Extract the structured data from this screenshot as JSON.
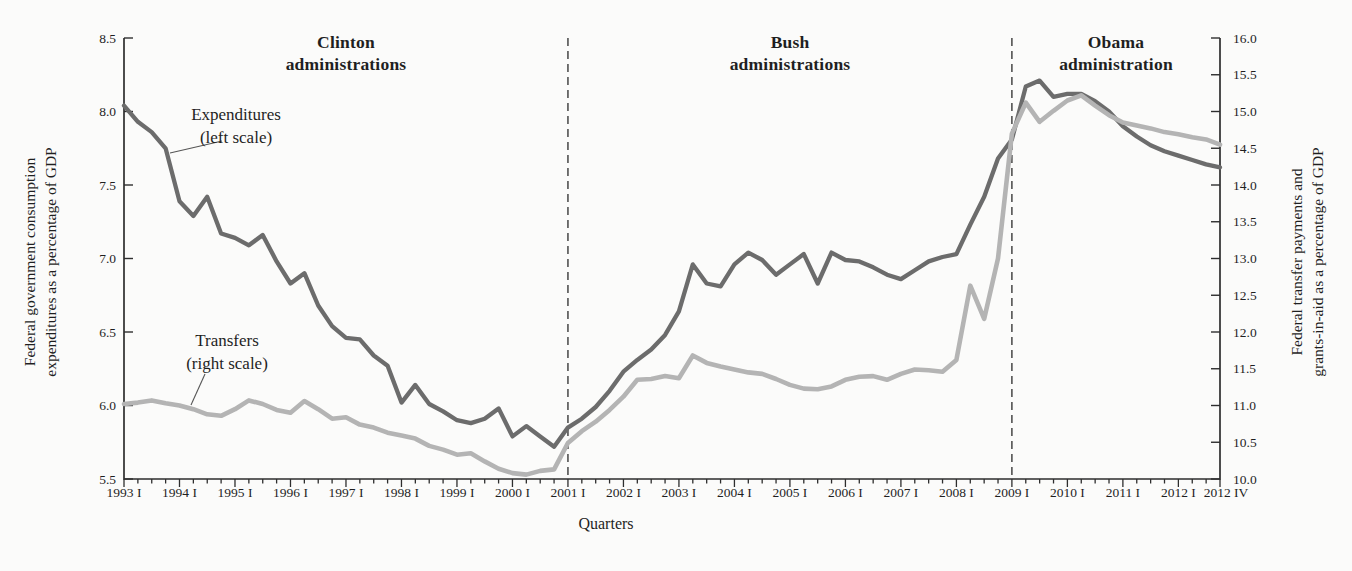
{
  "figure": {
    "xlabel": "Quarters",
    "left_axis_title_line1": "Federal government consumption",
    "left_axis_title_line2": "expenditures as a percentage of GDP",
    "right_axis_title_line1": "Federal transfer payments and",
    "right_axis_title_line2": "grants-in-aid as a percentage of GDP",
    "annotations": {
      "clinton_line1": "Clinton",
      "clinton_line2": "administrations",
      "bush_line1": "Bush",
      "bush_line2": "administrations",
      "obama_line1": "Obama",
      "obama_line2": "administration",
      "expenditures_label_line1": "Expenditures",
      "expenditures_label_line2": "(left scale)",
      "transfers_label_line1": "Transfers",
      "transfers_label_line2": "(right scale)"
    },
    "colors": {
      "expenditures_line": "#6c6c6c",
      "transfers_line": "#b4b4b4",
      "axis": "#2e2e2e",
      "dashed_boundary": "#3a3a3a",
      "background": "#fbfbfa",
      "text": "#1f1f1f"
    }
  },
  "chart_data": {
    "type": "line",
    "frequency": "quarterly",
    "x_start": "1993 Q1",
    "x_end": "2012 Q4",
    "xlabel": "Quarters",
    "grid": "off",
    "x_tick_labels": [
      "1993 I",
      "1994 I",
      "1995 I",
      "1996 I",
      "1997 I",
      "1998 I",
      "1999 I",
      "2000 I",
      "2001 I",
      "2002 I",
      "2003 I",
      "2004 I",
      "2005 I",
      "2006 I",
      "2007 I",
      "2008 I",
      "2009 I",
      "2010 I",
      "2011 I",
      "2012 I",
      "2012 IV"
    ],
    "left_axis": {
      "title": "Federal government consumption expenditures as a percentage of GDP",
      "min": 5.5,
      "max": 8.5,
      "tick_step": 0.5,
      "tick_labels": [
        "8.5",
        "8.0",
        "7.5",
        "7.0",
        "6.5",
        "6.0",
        "5.5"
      ]
    },
    "right_axis": {
      "title": "Federal transfer payments and grants-in-aid as a percentage of GDP",
      "min": 10.0,
      "max": 16.0,
      "tick_step": 0.5,
      "tick_labels": [
        "16.0",
        "15.5",
        "15.0",
        "14.5",
        "14.0",
        "13.5",
        "13.0",
        "12.5",
        "12.0",
        "11.5",
        "11.0",
        "10.5",
        "10.0"
      ]
    },
    "administration_boundaries": [
      {
        "label": "Clinton administrations → Bush administrations",
        "at": "2001 Q1"
      },
      {
        "label": "Bush administrations → Obama administration",
        "at": "2009 Q1"
      }
    ],
    "series": [
      {
        "name": "Expenditures (left scale)",
        "axis": "left",
        "values": [
          8.04,
          7.93,
          7.86,
          7.75,
          7.39,
          7.29,
          7.42,
          7.17,
          7.14,
          7.09,
          7.16,
          6.98,
          6.83,
          6.9,
          6.68,
          6.54,
          6.46,
          6.45,
          6.34,
          6.27,
          6.02,
          6.14,
          6.01,
          5.96,
          5.9,
          5.88,
          5.91,
          5.98,
          5.79,
          5.86,
          5.79,
          5.72,
          5.85,
          5.91,
          5.99,
          6.1,
          6.23,
          6.31,
          6.38,
          6.48,
          6.64,
          6.96,
          6.83,
          6.81,
          6.96,
          7.04,
          6.99,
          6.89,
          6.96,
          7.03,
          6.83,
          7.04,
          6.99,
          6.98,
          6.94,
          6.89,
          6.86,
          6.92,
          6.98,
          7.01,
          7.03,
          7.23,
          7.42,
          7.68,
          7.81,
          8.17,
          8.21,
          8.1,
          8.12,
          8.12,
          8.07,
          8.0,
          7.9,
          7.83,
          7.77,
          7.73,
          7.7,
          7.67,
          7.64,
          7.62
        ]
      },
      {
        "name": "Transfers (right scale)",
        "axis": "right",
        "values": [
          11.02,
          11.04,
          11.07,
          11.03,
          11.0,
          10.95,
          10.88,
          10.86,
          10.95,
          11.07,
          11.02,
          10.94,
          10.9,
          11.06,
          10.95,
          10.82,
          10.84,
          10.74,
          10.7,
          10.63,
          10.59,
          10.55,
          10.45,
          10.4,
          10.33,
          10.35,
          10.24,
          10.14,
          10.08,
          10.06,
          10.11,
          10.13,
          10.49,
          10.65,
          10.78,
          10.94,
          11.12,
          11.35,
          11.36,
          11.4,
          11.37,
          11.68,
          11.58,
          11.53,
          11.49,
          11.45,
          11.43,
          11.36,
          11.28,
          11.23,
          11.22,
          11.26,
          11.35,
          11.39,
          11.4,
          11.35,
          11.43,
          11.49,
          11.48,
          11.46,
          11.62,
          12.63,
          12.18,
          13.0,
          14.7,
          15.12,
          14.86,
          15.01,
          15.15,
          15.22,
          15.08,
          14.95,
          14.85,
          14.81,
          14.77,
          14.72,
          14.69,
          14.65,
          14.62,
          14.55
        ]
      }
    ]
  }
}
